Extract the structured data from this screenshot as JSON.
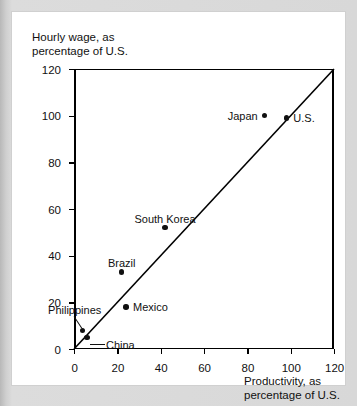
{
  "chart_data": {
    "type": "scatter",
    "title": "",
    "xlabel": "Productivity, as\npercentage of U.S.",
    "ylabel": "Hourly wage, as\npercentage of U.S.",
    "xlim": [
      0,
      120
    ],
    "ylim": [
      0,
      120
    ],
    "xticks": [
      0,
      20,
      40,
      60,
      80,
      100,
      120
    ],
    "yticks": [
      0,
      20,
      40,
      60,
      80,
      100,
      120
    ],
    "grid": false,
    "legend": "none",
    "reference_line": {
      "description": "45-degree line of equality",
      "from": [
        0,
        0
      ],
      "to": [
        120,
        120
      ]
    },
    "points": [
      {
        "name": "Philippines",
        "x": 4,
        "y": 8,
        "label_position": "above-leader"
      },
      {
        "name": "China",
        "x": 6,
        "y": 5,
        "label_position": "right-leader"
      },
      {
        "name": "Mexico",
        "x": 24,
        "y": 18,
        "label_position": "right"
      },
      {
        "name": "Brazil",
        "x": 22,
        "y": 33,
        "label_position": "above"
      },
      {
        "name": "South Korea",
        "x": 42,
        "y": 52,
        "label_position": "above"
      },
      {
        "name": "Japan",
        "x": 88,
        "y": 100,
        "label_position": "left"
      },
      {
        "name": "U.S.",
        "x": 98,
        "y": 99,
        "label_position": "right"
      }
    ]
  },
  "colors": {
    "marker": "#101010",
    "axis": "#000000",
    "text": "#111111",
    "card_background": "#ffffff",
    "page_background": "#d8d8d8"
  }
}
